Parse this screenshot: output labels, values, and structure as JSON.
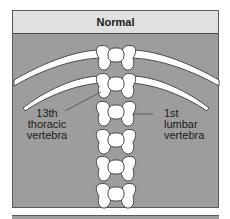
{
  "diagram": {
    "title": "Normal",
    "labels": {
      "left": [
        "13th",
        "thoracic",
        "vertebra"
      ],
      "right": [
        "1st",
        "lumbar",
        "vertebra"
      ]
    },
    "colors": {
      "header_bg": "#e0e0e0",
      "panel_bg": "#9d9d9d",
      "bone": "#ffffff",
      "outline": "#4a4a4a"
    },
    "vertebrae_count": 6,
    "rib_pairs": 2
  }
}
